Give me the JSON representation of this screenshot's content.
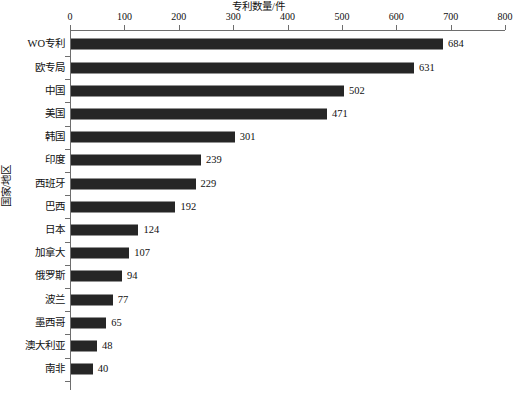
{
  "chart_data": {
    "type": "bar",
    "orientation": "horizontal",
    "title": "专利数量/件",
    "xlabel": "专利数量/件",
    "ylabel": "国家/地区",
    "xlim": [
      0,
      800
    ],
    "xticks": [
      0,
      100,
      200,
      300,
      400,
      500,
      600,
      700,
      800
    ],
    "xticklabels": [
      "0",
      "100",
      "200",
      "300",
      "400",
      "500",
      "600",
      "700",
      "800"
    ],
    "grid": false,
    "legend": false,
    "bar_color": "#262626",
    "categories": [
      "WO专利",
      "欧专局",
      "中国",
      "美国",
      "韩国",
      "印度",
      "西班牙",
      "巴西",
      "日本",
      "加拿大",
      "俄罗斯",
      "波兰",
      "墨西哥",
      "澳大利亚",
      "南非"
    ],
    "values": [
      684,
      631,
      502,
      471,
      301,
      239,
      229,
      192,
      124,
      107,
      94,
      77,
      65,
      48,
      40
    ],
    "value_labels": [
      "684",
      "631",
      "502",
      "471",
      "301",
      "239",
      "229",
      "192",
      "124",
      "107",
      "94",
      "77",
      "65",
      "48",
      "40"
    ]
  }
}
